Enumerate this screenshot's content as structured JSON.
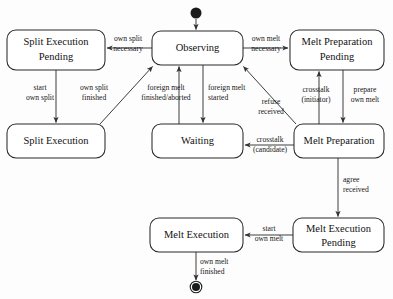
{
  "diagram": {
    "type": "state-machine",
    "colors": {
      "background": "#fdfdfd",
      "box_fill": "#ffffff",
      "box_stroke": "#2a2a2a",
      "edge": "#555555",
      "text": "#111111",
      "node": "#1a1a1a"
    },
    "states": [
      {
        "id": "split_execution_pending",
        "label_line1": "Split Execution",
        "label_line2": "Pending",
        "x": 7,
        "y": 30,
        "w": 98,
        "h": 40
      },
      {
        "id": "observing",
        "label_line1": "Observing",
        "label_line2": "",
        "x": 152,
        "y": 31,
        "w": 91,
        "h": 34
      },
      {
        "id": "melt_preparation_pending",
        "label_line1": "Melt Preparation",
        "label_line2": "Pending",
        "x": 290,
        "y": 30,
        "w": 94,
        "h": 40
      },
      {
        "id": "split_execution",
        "label_line1": "Split Execution",
        "label_line2": "",
        "x": 7,
        "y": 124,
        "w": 98,
        "h": 34
      },
      {
        "id": "waiting",
        "label_line1": "Waiting",
        "label_line2": "",
        "x": 152,
        "y": 124,
        "w": 91,
        "h": 34
      },
      {
        "id": "melt_preparation",
        "label_line1": "Melt Preparation",
        "label_line2": "",
        "x": 294,
        "y": 124,
        "w": 90,
        "h": 34
      },
      {
        "id": "melt_execution",
        "label_line1": "Melt Execution",
        "label_line2": "",
        "x": 150,
        "y": 218,
        "w": 93,
        "h": 34
      },
      {
        "id": "melt_execution_pending",
        "label_line1": "Melt Execution",
        "label_line2": "Pending",
        "x": 293,
        "y": 218,
        "w": 91,
        "h": 34
      }
    ],
    "pseudostates": [
      {
        "id": "initial_node",
        "kind": "initial",
        "cx": 196,
        "cy": 13,
        "r": 5.5
      },
      {
        "id": "final_node",
        "kind": "final",
        "cx": 196,
        "cy": 287,
        "r": 5.5
      }
    ],
    "transitions": [
      {
        "id": "start_to_observing",
        "from": "initial_node",
        "to": "observing",
        "label_line1": "",
        "label_line2": ""
      },
      {
        "id": "observing_to_split_execution_pending",
        "from": "observing",
        "to": "split_execution_pending",
        "label_line1": "own split",
        "label_line2": "necessary"
      },
      {
        "id": "observing_to_melt_preparation_pending",
        "from": "observing",
        "to": "melt_preparation_pending",
        "label_line1": "own melt",
        "label_line2": "necessary"
      },
      {
        "id": "split_execution_pending_to_split_execution",
        "from": "split_execution_pending",
        "to": "split_execution",
        "label_line1": "start",
        "label_line2": "own split"
      },
      {
        "id": "split_execution_to_observing",
        "from": "split_execution",
        "to": "observing",
        "label_line1": "own split",
        "label_line2": "finished"
      },
      {
        "id": "waiting_to_observing",
        "from": "waiting",
        "to": "observing",
        "label_line1": "foreign melt",
        "label_line2": "finished/aborted"
      },
      {
        "id": "observing_to_waiting",
        "from": "observing",
        "to": "waiting",
        "label_line1": "foreign melt",
        "label_line2": "started"
      },
      {
        "id": "melt_preparation_to_observing",
        "from": "melt_preparation",
        "to": "observing",
        "label_line1": "refuse",
        "label_line2": "received"
      },
      {
        "id": "melt_preparation_to_melt_preparation_pending",
        "from": "melt_preparation",
        "to": "melt_preparation_pending",
        "label_line1": "crosstalk",
        "label_line2": "(initiator)"
      },
      {
        "id": "melt_preparation_pending_to_melt_preparation",
        "from": "melt_preparation_pending",
        "to": "melt_preparation",
        "label_line1": "prepare",
        "label_line2": "own melt"
      },
      {
        "id": "melt_preparation_to_waiting",
        "from": "melt_preparation",
        "to": "waiting",
        "label_line1": "crosstalk",
        "label_line2": "(candidate)"
      },
      {
        "id": "melt_preparation_to_melt_execution_pending",
        "from": "melt_preparation",
        "to": "melt_execution_pending",
        "label_line1": "agree",
        "label_line2": "received"
      },
      {
        "id": "melt_execution_pending_to_melt_execution",
        "from": "melt_execution_pending",
        "to": "melt_execution",
        "label_line1": "start",
        "label_line2": "own melt"
      },
      {
        "id": "melt_execution_to_final",
        "from": "melt_execution",
        "to": "final_node",
        "label_line1": "own melt",
        "label_line2": "finished"
      }
    ]
  }
}
